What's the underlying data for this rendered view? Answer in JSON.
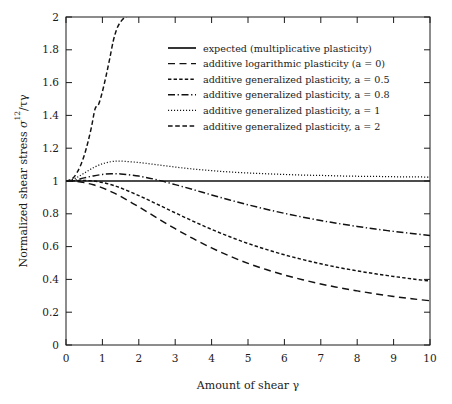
{
  "chart_data": {
    "type": "line",
    "title": "",
    "xlabel": "Amount of shear γ",
    "ylabel": "Normalized shear stress σ¹²/τγ",
    "ylabel_parts": {
      "prefix": "Normalized shear stress ",
      "symbol": "σ",
      "superscript": "12",
      "suffix": "/τγ"
    },
    "xlim": [
      0,
      10
    ],
    "ylim": [
      0,
      2
    ],
    "xticks": [
      0,
      1,
      2,
      3,
      4,
      5,
      6,
      7,
      8,
      9,
      10
    ],
    "xtick_labels": [
      "0",
      "1",
      "2",
      "3",
      "4",
      "5",
      "6",
      "7",
      "8",
      "9",
      "10"
    ],
    "yticks": [
      0,
      0.2,
      0.4,
      0.6,
      0.8,
      1,
      1.2,
      1.4,
      1.6,
      1.8,
      2
    ],
    "ytick_labels": [
      "0",
      "0.2",
      "0.4",
      "0.6",
      "0.8",
      "1",
      "1.2",
      "1.4",
      "1.6",
      "1.8",
      "2"
    ],
    "grid": false,
    "legend_position": "upper center",
    "line_color": "#111111",
    "background_color": "#ffffff",
    "series": [
      {
        "name": "expected (multiplicative plasticity)",
        "style": "solid",
        "x": [
          0,
          1,
          2,
          3,
          4,
          5,
          6,
          7,
          8,
          9,
          10
        ],
        "values": [
          1,
          1,
          1,
          1,
          1,
          1,
          1,
          1,
          1,
          1,
          1
        ]
      },
      {
        "name": "additive logarithmic plasticity (a = 0)",
        "style": "dashed",
        "x": [
          0,
          0.25,
          0.5,
          0.75,
          1,
          1.25,
          1.5,
          2,
          2.5,
          3,
          3.5,
          4,
          4.5,
          5,
          5.5,
          6,
          6.5,
          7,
          7.5,
          8,
          8.5,
          9,
          9.5,
          10
        ],
        "values": [
          1,
          0.998,
          0.99,
          0.977,
          0.958,
          0.934,
          0.906,
          0.842,
          0.775,
          0.709,
          0.648,
          0.592,
          0.542,
          0.498,
          0.46,
          0.427,
          0.398,
          0.372,
          0.35,
          0.33,
          0.312,
          0.296,
          0.282,
          0.27
        ]
      },
      {
        "name": "additive generalized plasticity, a = 0.5",
        "style": "smalldash",
        "x": [
          0,
          0.25,
          0.5,
          0.75,
          1,
          1.25,
          1.5,
          2,
          2.5,
          3,
          3.5,
          4,
          4.5,
          5,
          5.5,
          6,
          6.5,
          7,
          7.5,
          8,
          8.5,
          9,
          9.5,
          10
        ],
        "values": [
          1,
          1.002,
          1.003,
          1.0,
          0.991,
          0.977,
          0.958,
          0.911,
          0.859,
          0.806,
          0.754,
          0.705,
          0.66,
          0.619,
          0.583,
          0.55,
          0.521,
          0.495,
          0.472,
          0.452,
          0.434,
          0.418,
          0.403,
          0.39
        ]
      },
      {
        "name": "additive generalized plasticity, a = 0.8",
        "style": "dashdot",
        "x": [
          0,
          0.25,
          0.5,
          0.75,
          1,
          1.25,
          1.5,
          2,
          2.5,
          3,
          3.5,
          4,
          4.5,
          5,
          5.5,
          6,
          6.5,
          7,
          7.5,
          8,
          8.5,
          9,
          9.5,
          10
        ],
        "values": [
          1,
          1.006,
          1.019,
          1.031,
          1.04,
          1.044,
          1.043,
          1.03,
          1.007,
          0.978,
          0.947,
          0.915,
          0.884,
          0.855,
          0.828,
          0.803,
          0.78,
          0.759,
          0.74,
          0.723,
          0.707,
          0.693,
          0.68,
          0.668
        ]
      },
      {
        "name": "additive generalized plasticity, a = 1",
        "style": "dotted",
        "x": [
          0,
          0.25,
          0.5,
          0.75,
          1,
          1.25,
          1.5,
          2,
          2.5,
          3,
          3.5,
          4,
          4.5,
          5,
          5.5,
          6,
          6.5,
          7,
          7.5,
          8,
          8.5,
          9,
          9.5,
          10
        ],
        "values": [
          1,
          1.016,
          1.048,
          1.081,
          1.105,
          1.118,
          1.121,
          1.113,
          1.099,
          1.085,
          1.073,
          1.063,
          1.055,
          1.049,
          1.044,
          1.04,
          1.036,
          1.034,
          1.031,
          1.029,
          1.028,
          1.026,
          1.025,
          1.024
        ]
      },
      {
        "name": "additive generalized plasticity, a = 2",
        "style": "dashed2",
        "x": [
          0,
          0.1,
          0.2,
          0.3,
          0.4,
          0.5,
          0.6,
          0.7,
          0.8,
          0.9,
          1.0,
          1.1,
          1.2,
          1.3,
          1.4,
          1.5,
          1.6,
          1.66
        ],
        "values": [
          1,
          1.005,
          1.02,
          1.05,
          1.095,
          1.155,
          1.235,
          1.33,
          1.44,
          1.47,
          1.545,
          1.64,
          1.745,
          1.855,
          1.93,
          1.97,
          1.995,
          2.0
        ]
      }
    ],
    "annotations": []
  },
  "legend": {
    "items": [
      {
        "label": "expected (multiplicative plasticity)",
        "style": "solid"
      },
      {
        "label": "additive logarithmic plasticity (a = 0)",
        "style": "dashed"
      },
      {
        "label": "additive generalized plasticity, a = 0.5",
        "style": "smalldash"
      },
      {
        "label": "additive generalized plasticity, a = 0.8",
        "style": "dashdot"
      },
      {
        "label": "additive generalized plasticity, a = 1",
        "style": "dotted"
      },
      {
        "label": "additive generalized plasticity, a = 2",
        "style": "dashed2"
      }
    ]
  }
}
